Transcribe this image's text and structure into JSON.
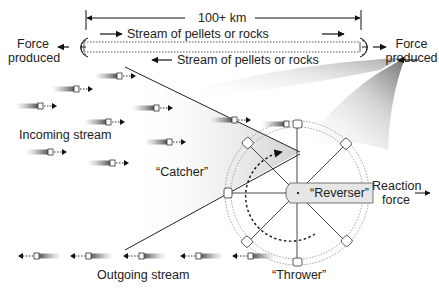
{
  "diagram": {
    "distance_label": "100+ km",
    "stream_top_label": "Stream of pellets or rocks",
    "stream_bottom_label": "Stream of pellets or rocks",
    "force_left": [
      "Force",
      "produced"
    ],
    "force_right": [
      "Force",
      "produced"
    ],
    "incoming_label": "Incoming stream",
    "catcher_label": "“Catcher”",
    "reverser_label": "“Reverser”",
    "reaction_label": [
      "Reaction",
      "force"
    ],
    "thrower_label": "“Thrower”",
    "outgoing_label": "Outgoing stream"
  }
}
